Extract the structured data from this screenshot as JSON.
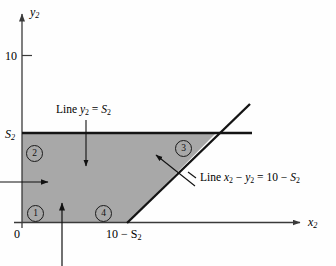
{
  "figure": {
    "title": "",
    "axes": {
      "y_label": "y",
      "y_label_sub": "2",
      "x_label": "x",
      "x_label_sub": "2",
      "origin_label": "0",
      "y_tick_10": "10",
      "y_tick_S2": "S",
      "y_tick_S2_sub": "2",
      "x_tick_10_minus_S2": "10 − S",
      "x_tick_10_minus_S2_sub": "2"
    },
    "annotations": [
      {
        "id": "line-y2-equals-s2",
        "prefix": "Line ",
        "var1": "y",
        "var1_sub": "2",
        "mid": " = ",
        "var2": "S",
        "var2_sub": "2",
        "full_text": "Line y2 = S2"
      },
      {
        "id": "line-x2-minus-y2",
        "prefix": "Line ",
        "var1": "x",
        "var1_sub": "2",
        "op": " − ",
        "var2": "y",
        "var2_sub": "2",
        "mid": " = 10 − ",
        "var3": "S",
        "var3_sub": "2",
        "full_text": "Line x2 − y2 = 10 − S2"
      }
    ],
    "regions": [
      {
        "id": "region-1",
        "label": "1"
      },
      {
        "id": "region-2",
        "label": "2"
      },
      {
        "id": "region-3",
        "label": "3"
      },
      {
        "id": "region-4",
        "label": "4"
      }
    ],
    "colors": {
      "shaded_region": "#a8a8a8",
      "line": "#1a1a1a",
      "axis": "#3a3a3a",
      "background": "#fefefe"
    }
  }
}
